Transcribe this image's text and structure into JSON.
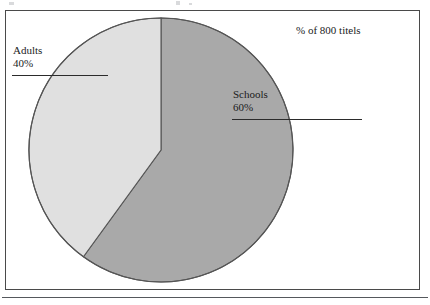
{
  "figure": {
    "background_color": "#ffffff",
    "frame_color": "#4a4a4a",
    "header_note": "% of 800 titels"
  },
  "chart_data": {
    "type": "pie",
    "title": "",
    "subtitle": "",
    "annotation": "% of 800 titels",
    "total_label": "800 titels",
    "total": 800,
    "unit": "%",
    "legend_position": "callout-labels",
    "grid": false,
    "categories": [
      "Schools",
      "Adults"
    ],
    "values": [
      60,
      40
    ],
    "slices": [
      {
        "name": "Schools",
        "label": "Schools",
        "value": 60,
        "value_label": "60%",
        "count": 480,
        "color": "#a9a9a9",
        "start_angle_deg": 0,
        "sweep_angle_deg": 216
      },
      {
        "name": "Adults",
        "label": "Adults",
        "value": 40,
        "value_label": "40%",
        "count": 320,
        "color": "#e0e0e0",
        "start_angle_deg": 216,
        "sweep_angle_deg": 144
      }
    ],
    "geometry": {
      "center_x": 161,
      "center_y": 150,
      "radius": 132,
      "outline_color": "#555555"
    }
  },
  "callouts": {
    "adults": {
      "name": "Adults",
      "percent": "40%"
    },
    "schools": {
      "name": "Schools",
      "percent": "60%"
    }
  }
}
